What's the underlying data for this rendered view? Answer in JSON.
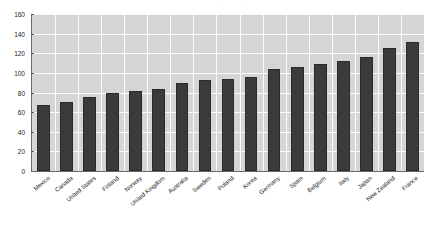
{
  "chart": {
    "title": "Health Spending",
    "background_color": "#ffffff",
    "plot_background_color": "#d5d5d5",
    "gridline_color": "#fbfbfb",
    "bar_color": "#3b3b3b",
    "axis_color": "#6a6a6a"
  },
  "chart_data": {
    "type": "bar",
    "title": "Health Spending",
    "subtitle": "",
    "xlabel": "",
    "ylabel": "",
    "ylim": [
      0,
      160
    ],
    "yticks": [
      0,
      20,
      40,
      60,
      80,
      100,
      120,
      140,
      160
    ],
    "grid": true,
    "legend": false,
    "legend_position": "none",
    "orientation": "vertical",
    "categories": [
      "Mexico",
      "Canada",
      "United States",
      "Finland",
      "Norway",
      "United Kingdom",
      "Australia",
      "Sweden",
      "Poland",
      "Korea",
      "Germany",
      "Spain",
      "Belgium",
      "Italy",
      "Japan",
      "New Zealand",
      "France"
    ],
    "values": [
      67,
      70,
      75,
      80,
      82,
      84,
      90,
      93,
      94,
      96,
      104,
      106,
      109,
      112,
      116,
      125,
      131
    ],
    "series": [
      {
        "name": "Value",
        "values": [
          67,
          70,
          75,
          80,
          82,
          84,
          90,
          93,
          94,
          96,
          104,
          106,
          109,
          112,
          116,
          125,
          131
        ]
      }
    ]
  }
}
